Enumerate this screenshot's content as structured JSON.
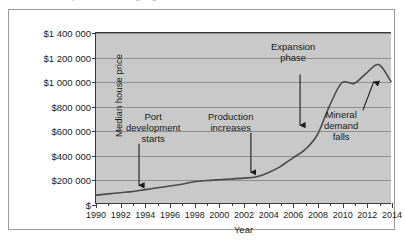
{
  "caption": {
    "cut_off_line": "Median house price in a mining region, 1990 to 2014"
  },
  "chart_data": {
    "type": "line",
    "title": "",
    "xlabel": "Year",
    "ylabel": "Median house price",
    "xlim": [
      1990,
      2014
    ],
    "ylim": [
      0,
      1400000
    ],
    "grid": true,
    "legend": "none",
    "plot_background": "#c9c9c9",
    "line_color": "#4a4a4a",
    "x_tick_labels": [
      "1990",
      "1992",
      "1994",
      "1996",
      "1998",
      "2000",
      "2002",
      "2004",
      "2006",
      "2008",
      "2010",
      "2012",
      "2014"
    ],
    "x_tick_values": [
      1990,
      1992,
      1994,
      1996,
      1998,
      2000,
      2002,
      2004,
      2006,
      2008,
      2010,
      2012,
      2014
    ],
    "x_minor_tick_values": [
      1991,
      1993,
      1995,
      1997,
      1999,
      2001,
      2003,
      2005,
      2007,
      2009,
      2011,
      2013
    ],
    "y_tick_labels": [
      "$",
      "$200 000",
      "$400 000",
      "$600 000",
      "$800 000",
      "$1 000 000",
      "$1 200 000",
      "$1 400 000"
    ],
    "y_tick_values": [
      0,
      200000,
      400000,
      600000,
      800000,
      1000000,
      1200000,
      1400000
    ],
    "series": [
      {
        "name": "Median house price",
        "x": [
          1990,
          1991,
          1992,
          1993,
          1994,
          1995,
          1996,
          1997,
          1998,
          1999,
          2000,
          2001,
          2002,
          2003,
          2004,
          2005,
          2006,
          2007,
          2008,
          2009,
          2010,
          2011,
          2012,
          2013,
          2014
        ],
        "values": [
          65000,
          75000,
          85000,
          95000,
          110000,
          125000,
          140000,
          155000,
          175000,
          185000,
          192000,
          198000,
          205000,
          215000,
          250000,
          300000,
          370000,
          440000,
          560000,
          800000,
          990000,
          985000,
          1070000,
          1140000,
          1000000
        ]
      }
    ],
    "annotations": [
      {
        "id": "port-development",
        "label_lines": [
          "Port",
          "development",
          "starts"
        ],
        "target_x": 1993.5,
        "target_y": 105000,
        "arrow": "down"
      },
      {
        "id": "production-increases",
        "label_lines": [
          "Production",
          "increases"
        ],
        "target_x": 2002.6,
        "target_y": 212000,
        "arrow": "down"
      },
      {
        "id": "expansion-phase",
        "label_lines": [
          "Expansion",
          "phase"
        ],
        "target_x": 2006.6,
        "target_y": 600000,
        "arrow": "down"
      },
      {
        "id": "mineral-demand-falls",
        "label_lines": [
          "Mineral",
          "demand",
          "falls"
        ],
        "target_x": 2012.6,
        "target_y": 1040000,
        "arrow": "up-left-diagonal"
      }
    ]
  }
}
